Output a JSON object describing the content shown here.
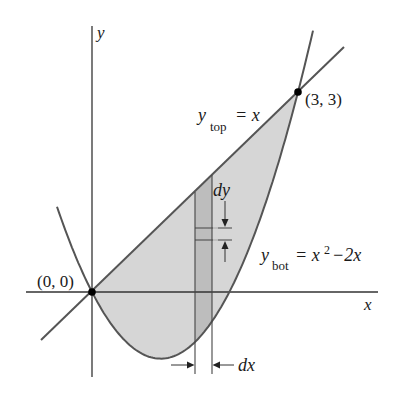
{
  "figure": {
    "colors": {
      "region_fill": "#d6d6d6",
      "strip_fill": "#b9b9b9",
      "curve_stroke": "#555555",
      "axis_stroke": "#333333",
      "point_fill": "#000000"
    },
    "axes": {
      "x_label": "x",
      "y_label": "y"
    },
    "curves": {
      "top": {
        "name": "y",
        "subscript": "top",
        "equation": "= x"
      },
      "bottom": {
        "name": "y",
        "subscript": "bot",
        "equation_prefix": "= x",
        "exponent": "2",
        "equation_suffix": "−2x"
      }
    },
    "points": [
      {
        "label": "(0, 0)",
        "x": 0,
        "y": 0
      },
      {
        "label": "(3, 3)",
        "x": 3,
        "y": 3
      }
    ],
    "annotations": {
      "dy_label": "dy",
      "dx_label": "dx"
    }
  }
}
